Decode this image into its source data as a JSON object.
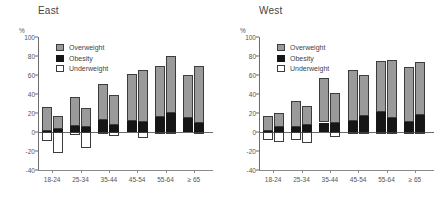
{
  "chart_data": [
    {
      "type": "bar",
      "title": "East",
      "xlabel": "",
      "ylabel": "%",
      "ylim": [
        -40,
        100
      ],
      "yticks": [
        -40,
        -20,
        0,
        20,
        40,
        60,
        80,
        100
      ],
      "grid": false,
      "legend_position": "top-left",
      "legend": [
        "Overweight",
        "Obesity",
        "Underweight"
      ],
      "categories": [
        "18-24",
        "25-34",
        "35-44",
        "45-54",
        "55-64",
        "≥ 65"
      ],
      "bars_per_category": 2,
      "series": [
        {
          "name": "Overweight",
          "bar": 1,
          "values": [
            25,
            31,
            38,
            49,
            53,
            45
          ]
        },
        {
          "name": "Obesity",
          "bar": 1,
          "values": [
            1,
            6,
            13,
            12,
            16,
            15
          ]
        },
        {
          "name": "Underweight",
          "bar": 1,
          "values": [
            -9,
            -3,
            -1,
            0,
            -1,
            0
          ]
        },
        {
          "name": "Overweight",
          "bar": 2,
          "values": [
            14,
            20,
            32,
            54,
            60,
            60
          ]
        },
        {
          "name": "Obesity",
          "bar": 2,
          "values": [
            3,
            5,
            7,
            11,
            20,
            10
          ]
        },
        {
          "name": "Underweight",
          "bar": 2,
          "values": [
            -22,
            -17,
            -4,
            -6,
            -1,
            -2
          ]
        }
      ],
      "totals": {
        "bar1": [
          26,
          37,
          51,
          61,
          69,
          60
        ],
        "bar2": [
          17,
          25,
          39,
          65,
          80,
          70
        ]
      }
    },
    {
      "type": "bar",
      "title": "West",
      "xlabel": "",
      "ylabel": "%",
      "ylim": [
        -40,
        100
      ],
      "yticks": [
        -40,
        -20,
        0,
        20,
        40,
        60,
        80,
        100
      ],
      "grid": false,
      "legend_position": "top-left",
      "legend": [
        "Overweight",
        "Obesity",
        "Underweight"
      ],
      "categories": [
        "18-24",
        "25-34",
        "35-44",
        "45-54",
        "55-64",
        "≥ 65"
      ],
      "bars_per_category": 2,
      "series": [
        {
          "name": "Overweight",
          "bar": 1,
          "values": [
            16,
            28,
            47,
            53,
            54,
            57
          ]
        },
        {
          "name": "Obesity",
          "bar": 1,
          "values": [
            1,
            5,
            10,
            12,
            21,
            11
          ]
        },
        {
          "name": "Underweight",
          "bar": 1,
          "values": [
            -8,
            -8,
            0,
            -1,
            -2,
            -1
          ]
        },
        {
          "name": "Overweight",
          "bar": 2,
          "values": [
            15,
            20,
            32,
            43,
            61,
            56
          ]
        },
        {
          "name": "Obesity",
          "bar": 2,
          "values": [
            5,
            7,
            9,
            17,
            15,
            18
          ]
        },
        {
          "name": "Underweight",
          "bar": 2,
          "values": [
            -10,
            -12,
            -5,
            -2,
            -1,
            -1
          ]
        }
      ],
      "totals": {
        "bar1": [
          17,
          33,
          57,
          65,
          75,
          68
        ],
        "bar2": [
          20,
          27,
          41,
          60,
          76,
          74
        ]
      }
    }
  ],
  "colors": {
    "overweight": "#9a9a9a",
    "obesity": "#161616",
    "underweight": "#ffffff",
    "outline": "#3c3c3c",
    "axis": "#6b6b6b",
    "text": "#555555",
    "background": "#ffffff"
  }
}
